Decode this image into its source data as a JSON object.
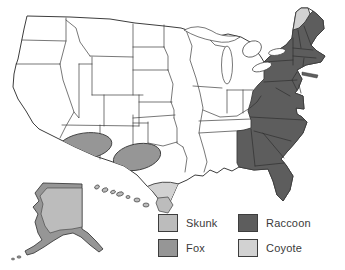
{
  "legend": {
    "items": [
      {
        "id": "skunk",
        "label": "Skunk"
      },
      {
        "id": "fox",
        "label": "Fox"
      },
      {
        "id": "raccoon",
        "label": "Raccoon"
      },
      {
        "id": "coyote",
        "label": "Coyote"
      }
    ]
  },
  "colors": {
    "skunk": "#bcbcbc",
    "fox": "#969696",
    "raccoon": "#5d5d5d",
    "coyote": "#d2d2d2",
    "outline": "#3d3d3d",
    "water": "#ffffff",
    "background": "#ffffff"
  },
  "map": {
    "subject": "United States map shaded by animal species region",
    "regions": [
      {
        "species": "Skunk",
        "areas": [
          "western United States",
          "midwest and plains states",
          "south-central states",
          "interior Alaska",
          "Hawaii"
        ]
      },
      {
        "species": "Fox",
        "areas": [
          "Arizona / New Mexico patch",
          "west-central Texas patch",
          "coastal Alaska rim"
        ]
      },
      {
        "species": "Raccoon",
        "areas": [
          "eastern seaboard from Maine to Florida",
          "New England",
          "New York",
          "Pennsylvania",
          "West Virginia",
          "Virginia",
          "Carolinas",
          "Georgia",
          "Alabama",
          "Florida"
        ]
      },
      {
        "species": "Coyote",
        "areas": [
          "southern tip of Texas",
          "northern Maine"
        ]
      }
    ]
  }
}
